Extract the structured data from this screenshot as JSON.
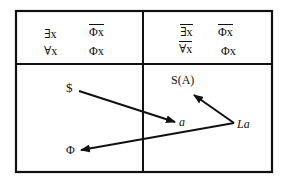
{
  "diagram": {
    "top_left": {
      "row1": {
        "quantifier": "∃x",
        "formula": "Φx",
        "quantifier_negated": false,
        "formula_negated": true
      },
      "row2": {
        "quantifier": "∀x",
        "formula": "Φx",
        "quantifier_negated": false,
        "formula_negated": false
      }
    },
    "top_right": {
      "row1": {
        "quantifier": "∃x",
        "formula": "Φx",
        "quantifier_negated": true,
        "formula_negated": true
      },
      "row2": {
        "quantifier": "∀x",
        "formula": "Φx",
        "quantifier_negated": true,
        "formula_negated": false
      }
    },
    "bottom": {
      "nodes": {
        "s_barred": "$",
        "a": "a",
        "phi": "Φ",
        "s_of_a": "S(A)",
        "La": "La"
      },
      "edges": [
        {
          "from": "s_barred",
          "to": "a"
        },
        {
          "from": "La",
          "to": "s_of_a"
        },
        {
          "from": "La",
          "to": "phi"
        }
      ]
    },
    "colors": {
      "line": "#111111",
      "background": "#ffffff"
    }
  }
}
